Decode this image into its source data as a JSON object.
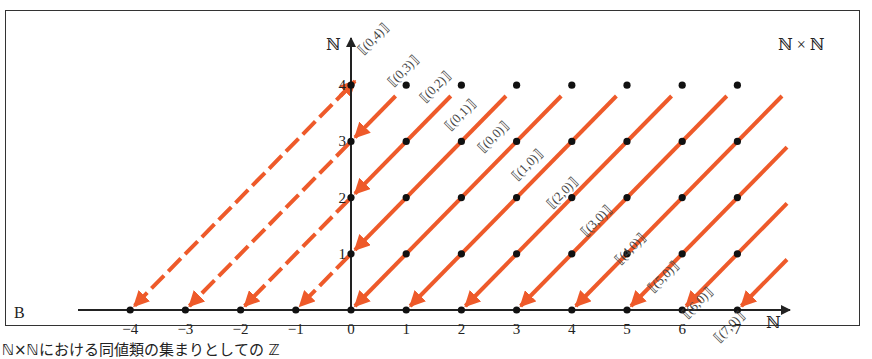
{
  "figure": {
    "panel_letter": "B",
    "set_label": "ℕ × ℕ",
    "x_axis_label": "ℕ",
    "y_axis_label": "ℕ",
    "x_ticks": [
      "−4",
      "−3",
      "−2",
      "−1",
      "0",
      "1",
      "2",
      "3",
      "4",
      "5",
      "6",
      "7"
    ],
    "y_ticks": [
      "1",
      "2",
      "3",
      "4"
    ],
    "class_labels": [
      "[(0,4)]",
      "[(0,3)]",
      "[(0,2)]",
      "[(0,1)]",
      "[(0,0)]",
      "[(1,0)]",
      "[(2,0)]",
      "[(3,0)]",
      "[(4,0)]",
      "[(5,0)]",
      "[(6,0)]",
      "[(7,0)]"
    ],
    "line_color": "#ee5a2a",
    "caption": "ℕ×ℕにおける同値類の集まりとしての ℤ"
  },
  "chart_data": {
    "type": "diagram",
    "title": "ℕ × ℕ",
    "xlabel": "ℕ",
    "ylabel": "ℕ",
    "x_range": [
      -4,
      7
    ],
    "y_range": [
      0,
      4
    ],
    "grid_points": "all (a,b) with 0≤a≤7, 0≤b≤4",
    "equivalence_lines": [
      {
        "label": "[(0,4)]",
        "maps_to": -4,
        "dashed_below_y_axis": true
      },
      {
        "label": "[(0,3)]",
        "maps_to": -3,
        "dashed_below_y_axis": true
      },
      {
        "label": "[(0,2)]",
        "maps_to": -2,
        "dashed_below_y_axis": true
      },
      {
        "label": "[(0,1)]",
        "maps_to": -1,
        "dashed_below_y_axis": true
      },
      {
        "label": "[(0,0)]",
        "maps_to": 0
      },
      {
        "label": "[(1,0)]",
        "maps_to": 1
      },
      {
        "label": "[(2,0)]",
        "maps_to": 2
      },
      {
        "label": "[(3,0)]",
        "maps_to": 3
      },
      {
        "label": "[(4,0)]",
        "maps_to": 4
      },
      {
        "label": "[(5,0)]",
        "maps_to": 5
      },
      {
        "label": "[(6,0)]",
        "maps_to": 6
      },
      {
        "label": "[(7,0)]",
        "maps_to": 7
      }
    ]
  }
}
